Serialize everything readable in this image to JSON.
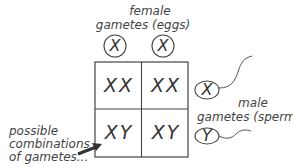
{
  "female_label": {
    "line1": "female",
    "line2": "gametes (eggs)"
  },
  "eggs": [
    "X",
    "X"
  ],
  "grid": [
    [
      "XX",
      "XX"
    ],
    [
      "XY",
      "XY"
    ]
  ],
  "sperm": [
    "X",
    "Y"
  ],
  "male_label": {
    "line1": "male",
    "line2": "gametes (sperm)"
  },
  "annotation": {
    "line1": "possible",
    "line2": "combinations",
    "line3": "of gametes..."
  }
}
